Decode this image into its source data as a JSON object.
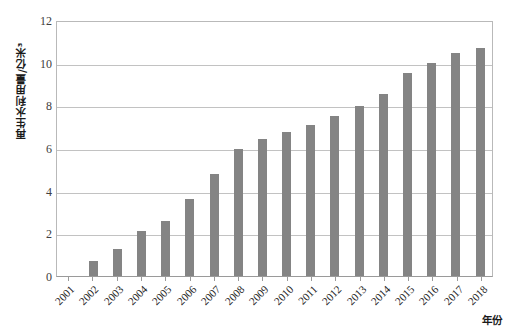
{
  "chart_data": {
    "type": "bar",
    "title": "",
    "subtitle": "",
    "xlabel": "年份",
    "ylabel": "再生水利用量/亿米³",
    "categories": [
      "2001",
      "2002",
      "2003",
      "2004",
      "2005",
      "2006",
      "2007",
      "2008",
      "2009",
      "2010",
      "2011",
      "2012",
      "2013",
      "2014",
      "2015",
      "2016",
      "2017",
      "2018"
    ],
    "values": [
      0,
      0.7,
      1.25,
      2.1,
      2.6,
      3.6,
      4.8,
      5.95,
      6.4,
      6.75,
      7.1,
      7.5,
      7.95,
      8.55,
      9.5,
      10.0,
      10.45,
      10.7
    ],
    "series": [
      {
        "name": "再生水利用量",
        "values": [
          0,
          0.7,
          1.25,
          2.1,
          2.6,
          3.6,
          4.8,
          5.95,
          6.4,
          6.75,
          7.1,
          7.5,
          7.95,
          8.55,
          9.5,
          10.0,
          10.45,
          10.7
        ]
      }
    ],
    "ylim": [
      0,
      12
    ],
    "yticks": [
      0,
      2,
      4,
      6,
      8,
      10,
      12
    ],
    "ytick_labels": [
      "0",
      "2",
      "4",
      "6",
      "8",
      "10",
      "12"
    ],
    "grid": "horizontal",
    "legend": "none",
    "bar_color": "#848484",
    "gridline_color": "#c2c2c2",
    "axis_color": "#9a9a9a",
    "background_color": "#ffffff"
  }
}
